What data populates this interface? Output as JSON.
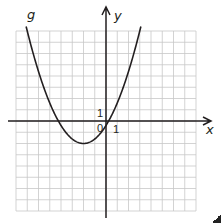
{
  "chart_data": {
    "type": "line",
    "title": "",
    "xlabel": "x",
    "ylabel": "y",
    "curve_label": "g",
    "xlim": [
      -8,
      8
    ],
    "ylim": [
      -8,
      8
    ],
    "grid": true,
    "grid_step": 1,
    "tick_labels": {
      "origin": "0",
      "x_unit": "1",
      "y_unit": "1"
    },
    "function": "g(x) = 0.4(x + 2)^2 - 2",
    "vertex": [
      -2,
      -2
    ],
    "x_intercepts": [
      -4.24,
      0.24
    ],
    "y_intercept": -0.4,
    "series": [
      {
        "name": "g",
        "x": [
          -7.1,
          -6,
          -5,
          -4,
          -3,
          -2,
          -1,
          0,
          1,
          2,
          3.1
        ],
        "values": [
          8.4,
          4.4,
          1.6,
          -0.4,
          -1.6,
          -2,
          -1.6,
          -0.4,
          1.6,
          4.4,
          8.4
        ]
      }
    ]
  },
  "labels": {
    "g": "g",
    "x": "x",
    "y": "y",
    "zero": "0",
    "one_x": "1",
    "one_y": "1"
  },
  "colors": {
    "grid": "#c8c8c8",
    "axis": "#231f20",
    "curve": "#231f20"
  }
}
